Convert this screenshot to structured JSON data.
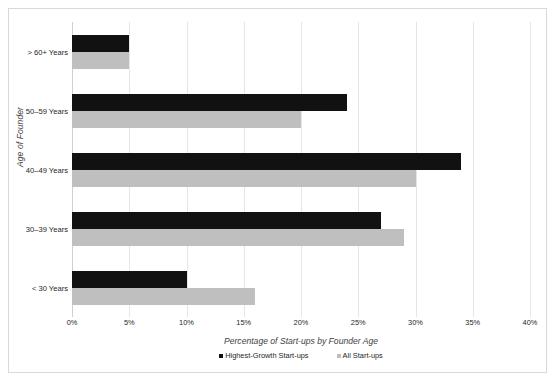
{
  "figure": {
    "border_color": "#d9d9d9",
    "background": "#ffffff"
  },
  "chart_data": {
    "type": "bar",
    "orientation": "horizontal",
    "title": "",
    "xlabel": "Percentage of Start-ups by Founder Age",
    "ylabel": "Age of Founder",
    "categories": [
      "< 30 Years",
      "30–39 Years",
      "40–49 Years",
      "50–59 Years",
      "> 60+ Years"
    ],
    "series": [
      {
        "name": "Highest-Growth Start-ups",
        "color": "#111111",
        "values": [
          10,
          27,
          34,
          24,
          5
        ]
      },
      {
        "name": "All Start-ups",
        "color": "#bfbfbf",
        "values": [
          16,
          29,
          30,
          20,
          5
        ]
      }
    ],
    "xlim": [
      0,
      40
    ],
    "xticks": [
      0,
      5,
      10,
      15,
      20,
      25,
      30,
      35,
      40
    ],
    "xticklabels": [
      "0%",
      "5%",
      "10%",
      "15%",
      "20%",
      "25%",
      "30%",
      "35%",
      "40%"
    ],
    "grid": true,
    "grid_axis": "x",
    "legend_position": "bottom",
    "value_unit": "%"
  }
}
